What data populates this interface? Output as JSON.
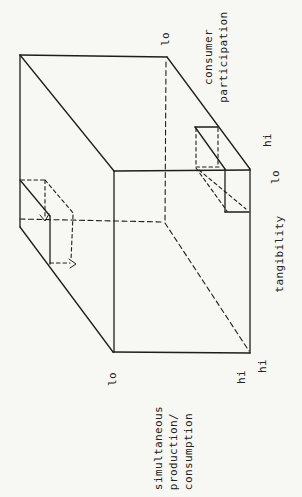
{
  "figure": {
    "type": "3d-classification-cube",
    "axes": [
      {
        "name": "consumer participation",
        "lo": "lo",
        "hi": "hi"
      },
      {
        "name": "tangibility",
        "lo": "lo",
        "hi": "hi"
      },
      {
        "name": "simultaneous production/consumption",
        "lo": "lo",
        "hi": "hi"
      }
    ]
  },
  "labels": {
    "cp_line1": "consumer",
    "cp_line2": "participation",
    "cp_lo": "lo",
    "cp_hi": "hi",
    "tang_name": "tangibility",
    "tang_lo": "lo",
    "tang_hi": "hi",
    "bottom_lo": "lo",
    "bottom_hi": "hi",
    "spc_line1": "simultaneous",
    "spc_line2": "production/",
    "spc_line3": "consumption"
  },
  "colors": {
    "ink": "#1e1e1c",
    "paper": "#f7f7f4"
  }
}
